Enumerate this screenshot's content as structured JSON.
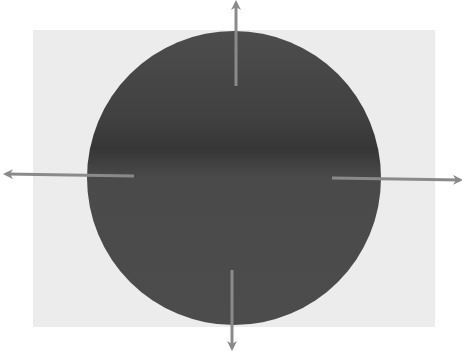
{
  "diagram": {
    "type": "radial-expansion",
    "background": {
      "color": "#ffffff"
    },
    "panel": {
      "x": 33,
      "y": 30,
      "width": 402,
      "height": 297,
      "color": "#ececec"
    },
    "circle": {
      "cx": 234,
      "cy": 178,
      "r": 147,
      "color": "#4b4b4b",
      "band_color": "#3a3a3a"
    },
    "arrows": [
      {
        "direction": "up",
        "x1": 236,
        "y1": 86,
        "x2": 236,
        "y2": 3,
        "color": "#8a8a8a"
      },
      {
        "direction": "down",
        "x1": 232,
        "y1": 270,
        "x2": 232,
        "y2": 348,
        "color": "#8a8a8a"
      },
      {
        "direction": "left",
        "x1": 134,
        "y1": 176,
        "x2": 6,
        "y2": 174,
        "color": "#8a8a8a"
      },
      {
        "direction": "right",
        "x1": 332,
        "y1": 178,
        "x2": 460,
        "y2": 180,
        "color": "#8a8a8a"
      }
    ]
  }
}
